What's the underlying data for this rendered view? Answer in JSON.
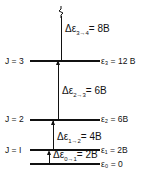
{
  "levels": [
    {
      "j": "J = 3",
      "energy": "ε₃ = 12 B"
    },
    {
      "j": "J = 2",
      "energy": "ε₂ = 6B"
    },
    {
      "j": "J = I",
      "energy": "ε₁ = 2B"
    },
    {
      "j": "",
      "energy": "ε₀ = 0"
    }
  ],
  "transitions": [
    {
      "label": "Δε",
      "sub": "3→4",
      "value": "= 8B"
    },
    {
      "label": "Δε",
      "sub": "2→3",
      "value": "= 6B"
    },
    {
      "label": "Δε",
      "sub": "1→2",
      "value": "= 4B"
    },
    {
      "label": "Δε",
      "sub": "0→1",
      "value": "= 2B"
    }
  ]
}
